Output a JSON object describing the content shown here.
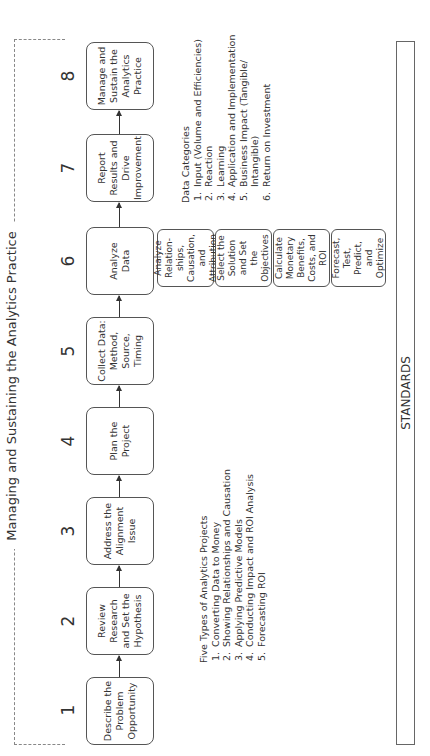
{
  "frame_title": "Managing and Sustaining the Analytics Practice",
  "steps": [
    {
      "number": "1",
      "label": "Describe the Problem Opportunity"
    },
    {
      "number": "2",
      "label": "Review Research and Set the Hypothesis"
    },
    {
      "number": "3",
      "label": "Address the Alignment Issue"
    },
    {
      "number": "4",
      "label": "Plan the Project"
    },
    {
      "number": "5",
      "label": "Collect Data: Method, Source, Timing"
    },
    {
      "number": "6",
      "label": "Analyze Data"
    },
    {
      "number": "7",
      "label": "Report Results and Drive Improvement"
    },
    {
      "number": "8",
      "label": "Manage and Sustain the Analytics Practice"
    }
  ],
  "analyze_substeps": [
    "Analyze Relation-ships, Causation, and Attribution",
    "Select the Solution and Set the Objectives",
    "Calculate Monetary Benefits, Costs, and ROI",
    "Forecast, Test, Predict, and Optimize"
  ],
  "project_types": {
    "title": "Five Types of Analytics Projects",
    "items": [
      "Converting Data to Money",
      "Showing Relationships and Causation",
      "Applying Predictive Models",
      "Conducting Impact and ROI Analysis",
      "Forecasting ROI"
    ]
  },
  "data_categories": {
    "title": "Data Categories",
    "items": [
      "Input (Volume and Efficiencies)",
      "Reaction",
      "Learning",
      "Application and Implementation",
      "Business Impact (Tangible/ Intangible)",
      "Return on Investment"
    ]
  },
  "standards_label": "STANDARDS"
}
